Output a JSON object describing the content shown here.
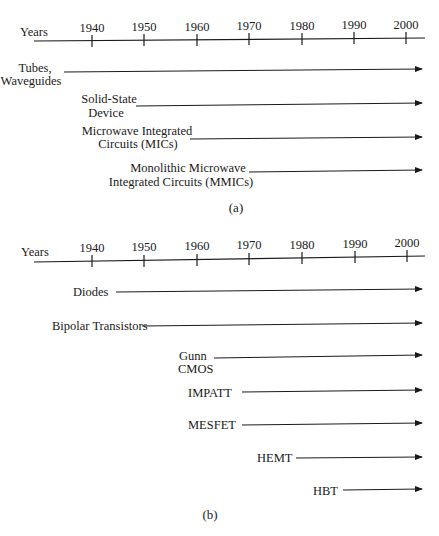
{
  "panels": [
    {
      "id": "a",
      "caption": "(a)",
      "axis_label": "Years",
      "ticks": [
        "1940",
        "1950",
        "1960",
        "1970",
        "1980",
        "1990",
        "2000"
      ],
      "items": [
        {
          "lines": [
            "Tubes,",
            "Waveguides"
          ],
          "start_year": 1935
        },
        {
          "lines": [
            "Solid-State",
            "Device"
          ],
          "start_year": 1950
        },
        {
          "lines": [
            "Microwave Integrated",
            "Circuits (MICs)"
          ],
          "start_year": 1960
        },
        {
          "lines": [
            "Monolithic Microwave",
            "Integrated Circuits (MMICs)"
          ],
          "start_year": 1976
        }
      ]
    },
    {
      "id": "b",
      "caption": "(b)",
      "axis_label": "Years",
      "ticks": [
        "1940",
        "1950",
        "1960",
        "1970",
        "1980",
        "1990",
        "2000"
      ],
      "items": [
        {
          "lines": [
            "Diodes"
          ],
          "start_year": 1946
        },
        {
          "lines": [
            "Bipolar Transistors"
          ],
          "start_year": 1946
        },
        {
          "lines": [
            "Gunn",
            "CMOS"
          ],
          "start_year": 1963
        },
        {
          "lines": [
            "IMPATT"
          ],
          "start_year": 1969
        },
        {
          "lines": [
            "MESFET"
          ],
          "start_year": 1969
        },
        {
          "lines": [
            "HEMT"
          ],
          "start_year": 1980
        },
        {
          "lines": [
            "HBT"
          ],
          "start_year": 1989
        }
      ]
    }
  ]
}
